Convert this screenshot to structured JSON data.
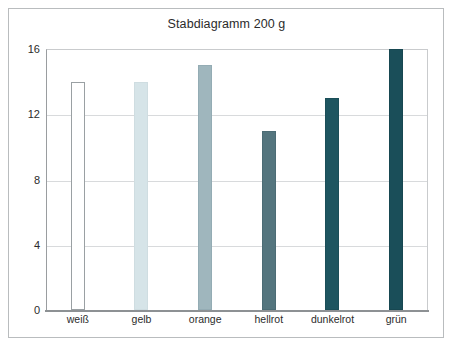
{
  "chart_data": {
    "type": "bar",
    "title": "Stabdiagramm 200 g",
    "xlabel": "",
    "ylabel": "",
    "categories": [
      "weiß",
      "gelb",
      "orange",
      "hellrot",
      "dunkelrot",
      "grün"
    ],
    "values": [
      14,
      14,
      15,
      11,
      13,
      16
    ],
    "series": [
      {
        "name": "Stabdiagramm 200 g",
        "values": [
          14,
          14,
          15,
          11,
          13,
          16
        ]
      }
    ],
    "ylim": [
      0,
      16
    ],
    "yticks": [
      0,
      4,
      8,
      12,
      16
    ],
    "ytick_labels": [
      "0",
      "4",
      "8",
      "12",
      "16"
    ],
    "grid": true,
    "grid_axis": "y",
    "legend": false,
    "legend_position": "none",
    "bar_colors": [
      "#ffffff",
      "#d6e4e8",
      "#9fb6bd",
      "#54757e",
      "#1e5560",
      "#1a4e59"
    ],
    "bar_edge_colors": [
      "#9aa0a3",
      "#cfdde1",
      "#94acb4",
      "#4c6c75",
      "#1b4e58",
      "#174751"
    ]
  },
  "figure": {
    "background_color": "#ffffff",
    "border_color": "#b9bcbe",
    "axis_color": "#8d9194",
    "gridline_color": "#d8dadc",
    "text_color": "#2b2b2b"
  }
}
